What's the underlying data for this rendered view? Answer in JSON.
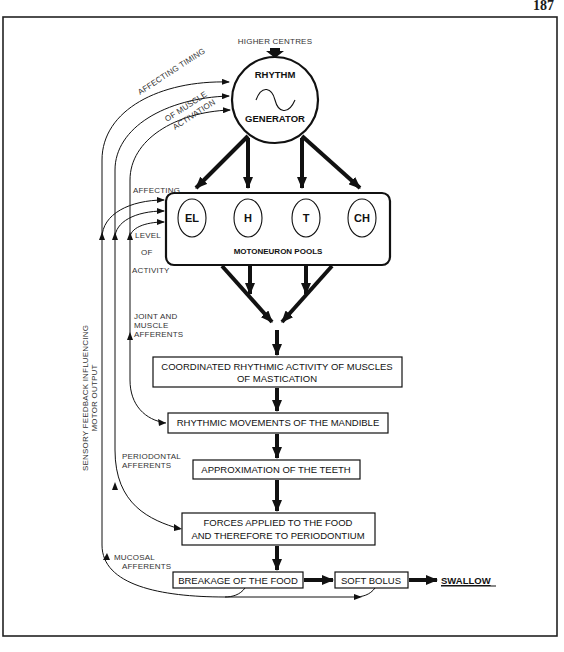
{
  "page_number": "187",
  "colors": {
    "ink": "#111111",
    "frame": "#222222",
    "label": "#333333",
    "background": "#ffffff"
  },
  "top_input": {
    "label": "HIGHER CENTRES"
  },
  "rhythm_generator": {
    "line1": "RHYTHM",
    "line2": "GENERATOR",
    "icon": "sine-wave-icon"
  },
  "feedback_labels": {
    "affecting_timing": "AFFECTING  TIMING",
    "of_muscle": "OF MUSCLE",
    "activation": "ACTIVATION",
    "affecting": "AFFECTING",
    "level": "LEVEL",
    "of": "OF",
    "activity": "ACTIVITY",
    "sensory_line1": "SENSORY FEEDBACK INFLUENCING",
    "sensory_line2": "MOTOR OUTPUT"
  },
  "motoneuron": {
    "title": "MOTONEURON POOLS",
    "pools": [
      "EL",
      "H",
      "T",
      "CH"
    ]
  },
  "afferents": {
    "joint_line1": "JOINT AND",
    "joint_line2": "MUSCLE",
    "joint_line3": "AFFERENTS",
    "periodontal_line1": "PERIODONTAL",
    "periodontal_line2": "AFFERENTS",
    "mucosal_line1": "MUCOSAL",
    "mucosal_line2": "AFFERENTS"
  },
  "flow_boxes": {
    "coordinated_line1": "COORDINATED RHYTHMIC ACTIVITY OF MUSCLES",
    "coordinated_line2": "OF MASTICATION",
    "rhythmic_movements": "RHYTHMIC MOVEMENTS OF THE MANDIBLE",
    "approximation": "APPROXIMATION OF THE TEETH",
    "forces_line1": "FORCES APPLIED TO THE FOOD",
    "forces_line2": "AND THEREFORE TO PERIODONTIUM",
    "breakage": "BREAKAGE OF THE FOOD",
    "soft_bolus": "SOFT BOLUS",
    "swallow": "SWALLOW"
  }
}
